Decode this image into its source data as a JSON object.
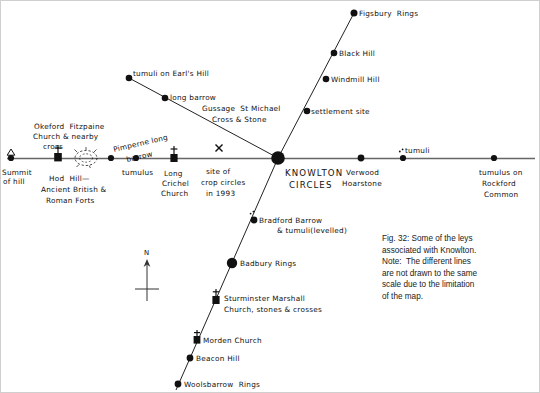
{
  "figure": {
    "title": "Some of the leys associated with Knowlton",
    "background": "#ffffff",
    "ink_color": "#111111",
    "line_color": "#555555"
  },
  "compass": {
    "label": "N",
    "name": "north-arrow"
  },
  "center": {
    "label_line1": "KNOWLTON",
    "label_line2": "CIRCLES",
    "x": 277,
    "y": 157
  },
  "caption": {
    "lines": [
      "Fig. 32: Some of the leys",
      "associated with Knowlton.",
      "Note:  The different lines",
      "are not drawn to the same",
      "scale due to the limitation",
      "of the map."
    ]
  },
  "leys": [
    {
      "name": "horizontal-ley-west",
      "orientation": "horizontal-west",
      "points": [
        {
          "label": "Summit\nof hill",
          "label_lines": [
            "Summit",
            "of hill"
          ],
          "marker": "triangle-dot",
          "x": 10,
          "y": 157
        },
        {
          "label": "Okeford Fitzpaine Church & nearby cross",
          "label_lines": [
            "Okeford  Fitzpaine",
            "Church & nearby",
            "cross"
          ],
          "marker": "church-square",
          "x": 57,
          "y": 157
        },
        {
          "label": "Hod Hill— Ancient British & Roman Forts",
          "label_lines": [
            "Hod  Hill—",
            "Ancient British &",
            "Roman Forts"
          ],
          "marker": "hillfort",
          "x": 85,
          "y": 157
        },
        {
          "label": "Pimperne long barrow",
          "label_lines": [
            "Pimperne long",
            "barrow"
          ],
          "marker": "dot",
          "x": 110,
          "y": 157
        },
        {
          "label": "tumulus",
          "label_lines": [
            "tumulus"
          ],
          "marker": "dot",
          "x": 135,
          "y": 157
        },
        {
          "label": "Long Crichel Church",
          "label_lines": [
            "Long",
            "Crichel",
            "Church"
          ],
          "marker": "church-cross",
          "x": 173,
          "y": 157
        },
        {
          "label": "site of crop circles in 1993",
          "label_lines": [
            "site of",
            "crop circles",
            "in 1993"
          ],
          "marker": "x-mark",
          "x": 218,
          "y": 157
        }
      ]
    },
    {
      "name": "horizontal-ley-east",
      "orientation": "horizontal-east",
      "points": [
        {
          "label": "Verwood Hoarstone",
          "label_lines": [
            "Verwood",
            "Hoarstone"
          ],
          "marker": "dot",
          "x": 360,
          "y": 157
        },
        {
          "label": "tumuli",
          "label_lines": [
            "tumuli"
          ],
          "marker": "dot-with-specks",
          "x": 402,
          "y": 157
        },
        {
          "label": "tumulus on Rockford Common",
          "label_lines": [
            "tumulus on",
            "Rockford",
            "Common"
          ],
          "marker": "dot",
          "x": 493,
          "y": 157
        }
      ]
    },
    {
      "name": "northeast-ley",
      "orientation": "northeast",
      "points": [
        {
          "label": "settlement site",
          "label_lines": [
            "settlement site"
          ],
          "marker": "dot",
          "x": 306,
          "y": 110
        },
        {
          "label": "Windmill Hill",
          "label_lines": [
            "Windmill Hill"
          ],
          "marker": "dot",
          "x": 325,
          "y": 78
        },
        {
          "label": "Black Hill",
          "label_lines": [
            "Black Hill"
          ],
          "marker": "dot",
          "x": 333,
          "y": 52
        },
        {
          "label": "Figsbury Rings",
          "label_lines": [
            "Figsbury  Rings"
          ],
          "marker": "dot",
          "x": 353,
          "y": 12
        }
      ]
    },
    {
      "name": "northwest-ley",
      "orientation": "northwest",
      "points": [
        {
          "label": "Gussage St Michael Cross & Stone",
          "label_lines": [
            "Gussage  St Michael",
            "Cross & Stone"
          ],
          "marker": "none",
          "x": 230,
          "y": 112
        },
        {
          "label": "long barrow",
          "label_lines": [
            "long barrow"
          ],
          "marker": "dot",
          "x": 164,
          "y": 97
        },
        {
          "label": "tumuli on Earl's Hill",
          "label_lines": [
            "tumuli on Earl's Hill"
          ],
          "marker": "dot",
          "x": 128,
          "y": 77
        }
      ]
    },
    {
      "name": "south-southwest-ley",
      "orientation": "south-southwest",
      "points": [
        {
          "label": "Bradford Barrow & tumuli (levelled)",
          "label_lines": [
            "Bradford Barrow",
            "& tumuli(levelled)"
          ],
          "marker": "dot-with-specks",
          "x": 253,
          "y": 219
        },
        {
          "label": "Badbury Rings",
          "label_lines": [
            "Badbury Rings"
          ],
          "marker": "big-dot",
          "x": 231,
          "y": 262
        },
        {
          "label": "Sturminster Marshall Church, stones & crosses",
          "label_lines": [
            "Sturminster Marshall",
            "Church, stones & crosses"
          ],
          "marker": "church-square",
          "x": 215,
          "y": 299
        },
        {
          "label": "Morden Church",
          "label_lines": [
            "Morden Church"
          ],
          "marker": "church-square",
          "x": 196,
          "y": 339
        },
        {
          "label": "Beacon Hill",
          "label_lines": [
            "Beacon Hill"
          ],
          "marker": "dot",
          "x": 189,
          "y": 357
        },
        {
          "label": "Woolsbarrow Rings",
          "label_lines": [
            "Woolsbarrow  Rings"
          ],
          "marker": "dot",
          "x": 177,
          "y": 383
        }
      ]
    }
  ]
}
